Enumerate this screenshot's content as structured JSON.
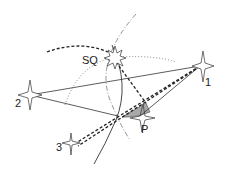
{
  "labels": {
    "sq": "SQ",
    "star1": "1",
    "star2": "2",
    "star3": "3",
    "p": "P"
  },
  "colors": {
    "ink": "#222222",
    "shade": "#a8a8a8",
    "background": "#ffffff"
  }
}
